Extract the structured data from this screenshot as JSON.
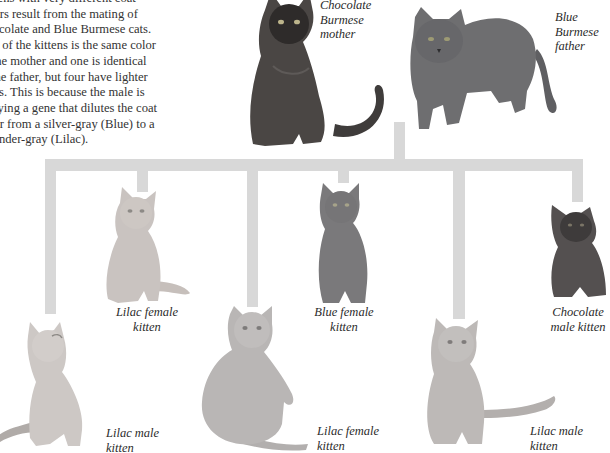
{
  "intro": {
    "lines": [
      "Kittens with very different coat",
      "colors result from the mating of",
      "Chocolate and Blue Burmese cats.",
      "One of the kittens is the same color",
      "as the mother and one is identical",
      "to the father, but four have lighter",
      "coats. This is because the male is",
      "carrying a gene that dilutes the coat",
      "color from a silver-gray (Blue) to a",
      "lavender-gray (Lilac)."
    ]
  },
  "parents": {
    "mother": {
      "label_lines": [
        "Chocolate",
        "Burmese",
        "mother"
      ],
      "color": "#4a4644"
    },
    "father": {
      "label_lines": [
        "Blue",
        "Burmese",
        "father"
      ],
      "color": "#6e6e70"
    }
  },
  "kittens": [
    {
      "id": "lilac-female-1",
      "label_lines": [
        "Lilac female",
        "kitten"
      ],
      "color": "#c9c3c0"
    },
    {
      "id": "lilac-male-1",
      "label_lines": [
        "Lilac male",
        "kitten"
      ],
      "color": "#cdc8c5"
    },
    {
      "id": "lilac-female-2",
      "label_lines": [
        "Lilac female",
        "kitten"
      ],
      "color": "#b9b6b5"
    },
    {
      "id": "blue-female",
      "label_lines": [
        "Blue female",
        "kitten"
      ],
      "color": "#7a797b"
    },
    {
      "id": "lilac-male-2",
      "label_lines": [
        "Lilac male",
        "kitten"
      ],
      "color": "#bdb9b7"
    },
    {
      "id": "chocolate-male",
      "label_lines": [
        "Chocolate",
        "male kitten"
      ],
      "color": "#545050"
    }
  ],
  "colors": {
    "connector": "#d8d8d8",
    "background": "#ffffff",
    "text": "#2b2b2b"
  }
}
